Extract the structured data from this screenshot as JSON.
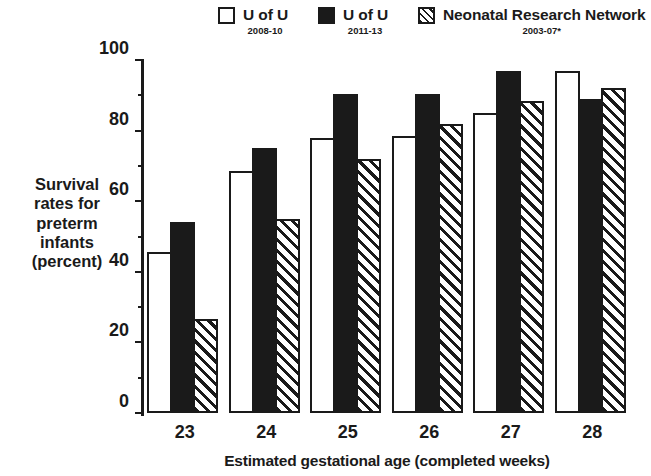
{
  "chart_data": {
    "type": "bar",
    "title": "",
    "xlabel": "Estimated gestational age (completed weeks)",
    "ylabel": "Survival rates for preterm infants (percent)",
    "ylabel_lines": [
      "Survival",
      "rates for",
      "preterm",
      "infants",
      "(percent)"
    ],
    "categories": [
      "23",
      "24",
      "25",
      "26",
      "27",
      "28"
    ],
    "ylim": [
      0,
      100
    ],
    "ytick_labels": [
      "0",
      "20",
      "40",
      "60",
      "80",
      "100"
    ],
    "ytick_values": [
      0,
      20,
      40,
      60,
      80,
      100
    ],
    "yminor_values": [
      10,
      30,
      50,
      70,
      90
    ],
    "grid": false,
    "legend_position": "top",
    "series": [
      {
        "name": "U of U",
        "period": "2008-10",
        "style": "open-white",
        "values": [
          45.5,
          68.5,
          78.0,
          78.5,
          85.0,
          97.0
        ]
      },
      {
        "name": "U of U",
        "period": "2011-13",
        "style": "solid-black",
        "values": [
          54.0,
          75.0,
          90.5,
          90.5,
          97.0,
          89.0
        ]
      },
      {
        "name": "Neonatal Research Network",
        "period": "2003-07*",
        "style": "diagonal-hatch",
        "values": [
          26.5,
          55.0,
          72.0,
          82.0,
          88.5,
          92.0
        ]
      }
    ]
  },
  "legend": {
    "items": [
      {
        "label": "U of U",
        "sublabel": "2008-10",
        "swatch": "open-square-swatch"
      },
      {
        "label": "U of U",
        "sublabel": "2011-13",
        "swatch": "filled-square-swatch"
      },
      {
        "label": "Neonatal Research Network",
        "sublabel": "2003-07*",
        "swatch": "hatched-square-swatch"
      }
    ]
  },
  "colors": {
    "ink": "#1a1a1a",
    "background": "#ffffff"
  }
}
